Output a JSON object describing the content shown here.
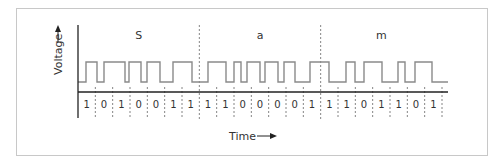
{
  "diagram": {
    "type": "manchester-encoding-waveform",
    "y_axis_label": "Voltage",
    "x_axis_label": "Time",
    "characters": [
      {
        "label": "S",
        "bits": [
          "1",
          "0",
          "1",
          "0",
          "0",
          "1",
          "1"
        ]
      },
      {
        "label": "a",
        "bits": [
          "1",
          "1",
          "0",
          "0",
          "0",
          "0",
          "1"
        ]
      },
      {
        "label": "m",
        "bits": [
          "1",
          "1",
          "0",
          "1",
          "1",
          "0",
          "1"
        ]
      }
    ],
    "waveform_edges_x": [
      86,
      97,
      104,
      125,
      129,
      141,
      147,
      160,
      173,
      192,
      208,
      226,
      234,
      241,
      247,
      260,
      265,
      278,
      284,
      295,
      310,
      329,
      346,
      355,
      364,
      382,
      398,
      405,
      415,
      432
    ],
    "waveform_start_level": "low",
    "colors": {
      "line": "#8a8a8a",
      "axis": "#222222",
      "text": "#333333",
      "frame": "#c8c8c8",
      "dash": "#777777"
    }
  }
}
